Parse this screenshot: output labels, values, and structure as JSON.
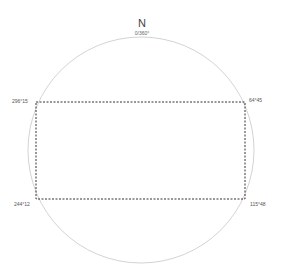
{
  "compass": {
    "north_label": "N",
    "north_bearing": "0/360°",
    "circle": {
      "cx": 141,
      "cy": 150,
      "r": 113,
      "stroke": "#c8c8c8"
    }
  },
  "rectangle": {
    "x": 36,
    "y": 102,
    "width": 209,
    "height": 97,
    "stroke": "#333333",
    "style": "dashed"
  },
  "corners": {
    "top_left": "296°15",
    "top_right": "64°45",
    "bottom_left": "244°12",
    "bottom_right": "115°48"
  }
}
